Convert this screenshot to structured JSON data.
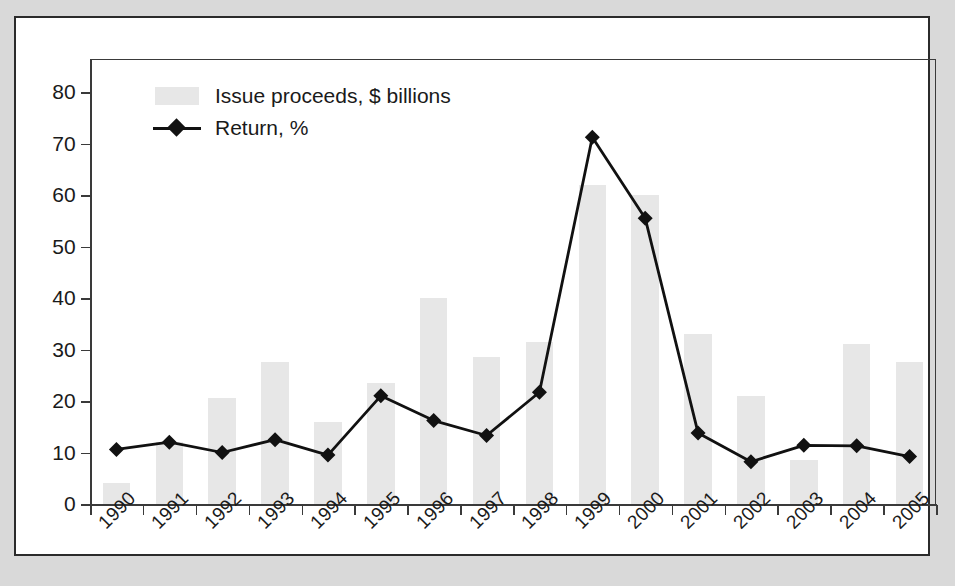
{
  "chart_data": {
    "type": "bar",
    "title": "",
    "subtitle": "",
    "xlabel": "",
    "ylabel": "",
    "ylim": [
      0,
      80
    ],
    "y_ticks": [
      0,
      10,
      20,
      30,
      40,
      50,
      60,
      70,
      80
    ],
    "grid": false,
    "legend_position": "top-left",
    "categories": [
      "1990",
      "1991",
      "1992",
      "1993",
      "1994",
      "1995",
      "1996",
      "1997",
      "1998",
      "1999",
      "2000",
      "2001",
      "2002",
      "2003",
      "2004",
      "2005"
    ],
    "series": [
      {
        "name": "Issue proceeds, $ billions",
        "type": "bar",
        "color": "#e7e7e7",
        "values": [
          4,
          12,
          20.5,
          27.5,
          16,
          23.5,
          40,
          28.5,
          31.5,
          62,
          60,
          33,
          21,
          8.5,
          31,
          27.5
        ]
      },
      {
        "name": "Return, %",
        "type": "line",
        "color": "#111111",
        "marker": "diamond",
        "values": [
          10.6,
          12,
          10,
          12.5,
          9.5,
          21,
          16.2,
          13.3,
          21.7,
          71.2,
          55.5,
          13.8,
          8.2,
          11.4,
          11.3,
          9.2
        ]
      }
    ]
  },
  "legend": {
    "items": [
      {
        "label": "Issue proceeds, $ billions",
        "key": "bar-swatch"
      },
      {
        "label": "Return, %",
        "key": "line-marker-swatch"
      }
    ]
  },
  "colors": {
    "bar_fill": "#e7e7e7",
    "line": "#111111",
    "axis": "#3a3a3a",
    "card_border": "#2b2b2b",
    "page_background": "#d9d9d9",
    "card_background": "#ffffff",
    "text": "#1a1a1a"
  }
}
